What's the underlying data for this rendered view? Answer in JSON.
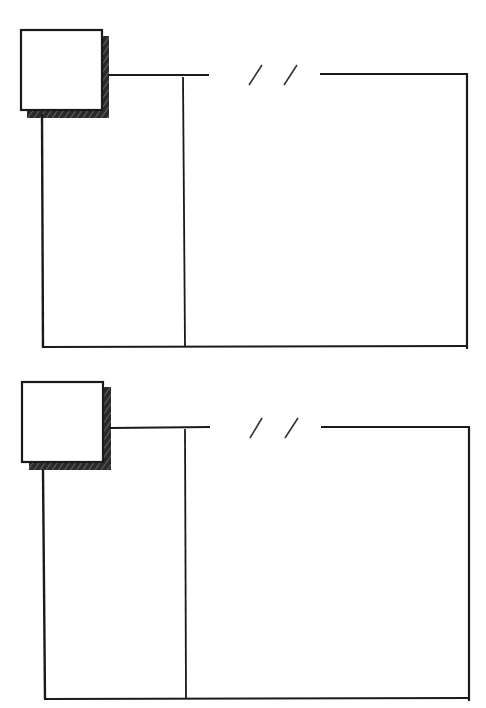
{
  "page": {
    "type": "blank journal worksheet",
    "background": "#ffffff",
    "ink": "#1a1a1a"
  },
  "panels": [
    {
      "label": "entry-1",
      "number_box": "",
      "date_placeholder": "/ /",
      "date_value": "",
      "left_column_text": "",
      "right_column_text": ""
    },
    {
      "label": "entry-2",
      "number_box": "",
      "date_placeholder": "/ /",
      "date_value": "",
      "left_column_text": "",
      "right_column_text": ""
    }
  ]
}
